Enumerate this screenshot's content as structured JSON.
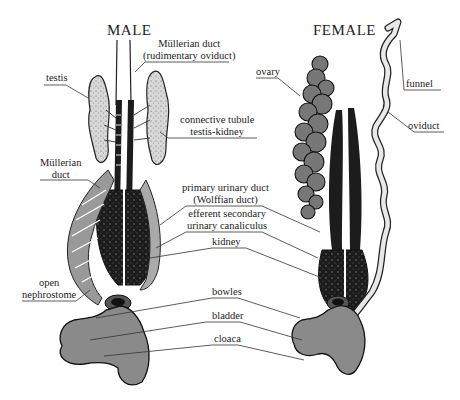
{
  "diagram": {
    "titles": {
      "male": "MALE",
      "female": "FEMALE"
    },
    "male_labels": {
      "mullerian_rudimentary_1": "Müllerian duct",
      "mullerian_rudimentary_2": "(rudimentary oviduct)",
      "testis": "testis",
      "connective_1": "connective tubule",
      "connective_2": "testis-kidney",
      "mullerian_duct_1": "Müllerian",
      "mullerian_duct_2": "duct",
      "open_nephrostome_1": "open",
      "open_nephrostome_2": "nephrostome"
    },
    "center_labels": {
      "primary_1": "primary urinary duct",
      "primary_2": "(Wolffian duct)",
      "efferent_1": "efferent secondary",
      "efferent_2": "urinary canaliculus",
      "kidney": "kidney",
      "bowles": "bowles",
      "bladder": "bladder",
      "cloaca": "cloaca"
    },
    "female_labels": {
      "ovary": "ovary",
      "funnel": "funnel",
      "oviduct": "oviduct"
    },
    "colors": {
      "ink": "#1a1a1a",
      "kidney_fill": "#1c1c1c",
      "organ_gray": "#8a8a8a",
      "testis_fill": "#cfcfcf",
      "leader_line": "#333333"
    }
  }
}
